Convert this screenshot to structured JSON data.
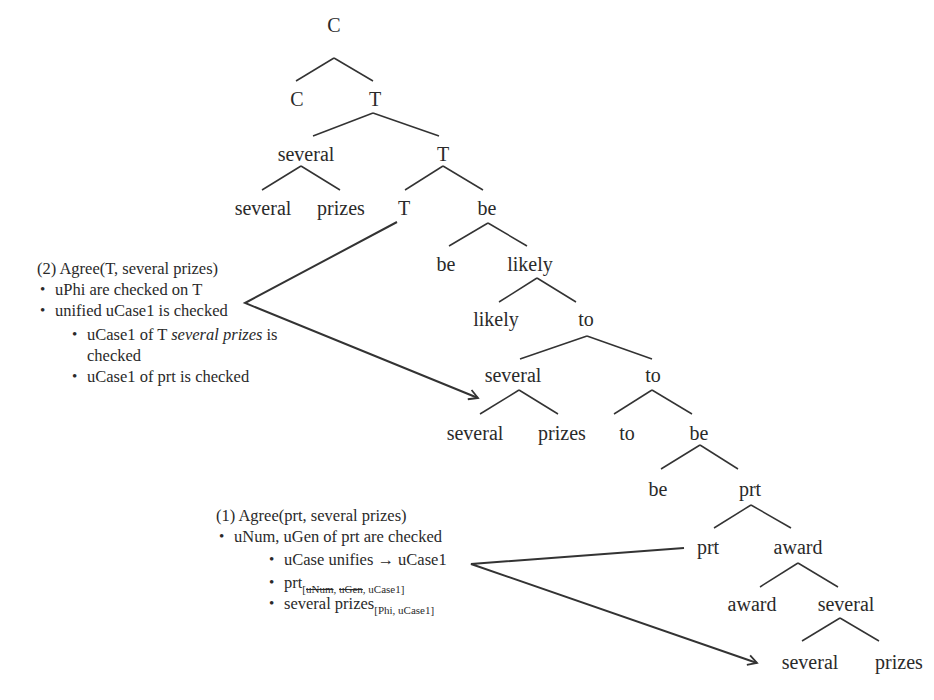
{
  "tree": {
    "nodes": [
      {
        "id": "n1",
        "label": "C",
        "x": 334,
        "y": 25
      },
      {
        "id": "n2",
        "label": "C",
        "x": 297,
        "y": 99
      },
      {
        "id": "n3",
        "label": "T",
        "x": 375,
        "y": 99
      },
      {
        "id": "n4",
        "label": "several",
        "x": 306,
        "y": 154
      },
      {
        "id": "n5",
        "label": "T",
        "x": 443,
        "y": 154
      },
      {
        "id": "n6",
        "label": "several",
        "x": 263,
        "y": 208
      },
      {
        "id": "n7",
        "label": "prizes",
        "x": 341,
        "y": 208
      },
      {
        "id": "n8",
        "label": "T",
        "x": 404,
        "y": 208
      },
      {
        "id": "n9",
        "label": "be",
        "x": 487,
        "y": 208
      },
      {
        "id": "n10",
        "label": "be",
        "x": 446,
        "y": 264
      },
      {
        "id": "n11",
        "label": "likely",
        "x": 530,
        "y": 264
      },
      {
        "id": "n12",
        "label": "likely",
        "x": 496,
        "y": 319
      },
      {
        "id": "n13",
        "label": "to",
        "x": 586,
        "y": 319
      },
      {
        "id": "n14",
        "label": "several",
        "x": 513,
        "y": 375
      },
      {
        "id": "n15",
        "label": "to",
        "x": 653,
        "y": 375
      },
      {
        "id": "n16",
        "label": "several",
        "x": 475,
        "y": 433
      },
      {
        "id": "n17",
        "label": "prizes",
        "x": 562,
        "y": 433
      },
      {
        "id": "n18",
        "label": "to",
        "x": 627,
        "y": 433
      },
      {
        "id": "n19",
        "label": "be",
        "x": 699,
        "y": 433
      },
      {
        "id": "n20",
        "label": "be",
        "x": 658,
        "y": 489
      },
      {
        "id": "n21",
        "label": "prt",
        "x": 750,
        "y": 489
      },
      {
        "id": "n22",
        "label": "prt",
        "x": 708,
        "y": 547
      },
      {
        "id": "n23",
        "label": "award",
        "x": 798,
        "y": 547
      },
      {
        "id": "n24",
        "label": "award",
        "x": 752,
        "y": 604
      },
      {
        "id": "n25",
        "label": "several",
        "x": 846,
        "y": 604
      },
      {
        "id": "n26",
        "label": "several",
        "x": 810,
        "y": 662
      },
      {
        "id": "n27",
        "label": "prizes",
        "x": 899,
        "y": 662
      }
    ],
    "edges": [
      [
        334,
        58,
        296,
        81
      ],
      [
        334,
        58,
        373,
        81
      ],
      [
        373,
        113,
        313,
        136
      ],
      [
        373,
        113,
        439,
        136
      ],
      [
        301,
        166,
        262,
        190
      ],
      [
        301,
        166,
        340,
        190
      ],
      [
        443,
        166,
        405,
        190
      ],
      [
        443,
        166,
        483,
        190
      ],
      [
        488,
        223,
        449,
        246
      ],
      [
        488,
        223,
        527,
        246
      ],
      [
        537,
        278,
        499,
        302
      ],
      [
        537,
        278,
        576,
        302
      ],
      [
        587,
        336,
        520,
        359
      ],
      [
        587,
        336,
        652,
        359
      ],
      [
        519,
        390,
        480,
        414
      ],
      [
        519,
        390,
        558,
        414
      ],
      [
        652,
        390,
        614,
        414
      ],
      [
        652,
        390,
        692,
        414
      ],
      [
        700,
        445,
        661,
        469
      ],
      [
        700,
        445,
        738,
        469
      ],
      [
        751,
        505,
        714,
        528
      ],
      [
        751,
        505,
        791,
        528
      ],
      [
        798,
        563,
        760,
        587
      ],
      [
        798,
        563,
        838,
        587
      ],
      [
        840,
        618,
        802,
        641
      ],
      [
        840,
        618,
        879,
        641
      ]
    ]
  },
  "annotation_2": {
    "title": "(2) Agree(T, several prizes)",
    "bullets": [
      "uPhi are checked on T",
      "unified uCase1 is checked"
    ],
    "sub_bullets": {
      "item1_prefix": "uCase1 of T ",
      "item1_italic": "several prizes",
      "item1_suffix": " is",
      "item1_cont": "checked",
      "item2": "uCase1 of prt is checked"
    }
  },
  "annotation_1": {
    "title": "(1) Agree(prt, several prizes)",
    "bullet": "uNum, uGen of prt are checked",
    "sub_bullets": {
      "unify": "uCase unifies → uCase1",
      "prt_label": "prt",
      "prt_sub_open": "[",
      "prt_sub_struck_1": "uNum",
      "prt_sub_sep": ", ",
      "prt_sub_struck_2": "uGen",
      "prt_sub_rest": ", uCase1]",
      "sp_label": "several prizes",
      "sp_sub": "[Phi, uCase1]"
    }
  },
  "colors": {
    "line": "#333333",
    "text": "#2a2a2a",
    "background": "#ffffff"
  }
}
